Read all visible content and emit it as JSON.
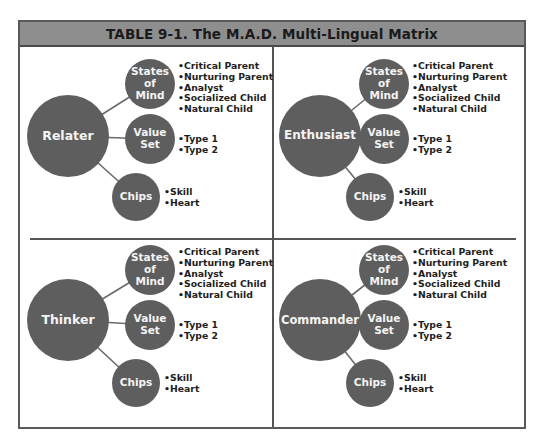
{
  "title": "TABLE 9-1.  The M.A.D. Multi-Lingual Matrix",
  "colors": {
    "header_bg": "#8e8e8e",
    "circle_fill": "#5e5e5e",
    "circle_text": "#f4f4f4",
    "border": "#555555",
    "list_text": "#1e1e1e"
  },
  "quadrants": [
    {
      "type": "Relater",
      "nodes": [
        {
          "label": "States of Mind",
          "lines": [
            "States",
            "of",
            "Mind"
          ],
          "items": [
            "Critical Parent",
            "Nurturing Parent",
            "Analyst",
            "Socialized Child",
            "Natural Child"
          ]
        },
        {
          "label": "Value Set",
          "lines": [
            "Value",
            "Set"
          ],
          "items": [
            "Type 1",
            "Type 2"
          ]
        },
        {
          "label": "Chips",
          "lines": [
            "Chips"
          ],
          "items": [
            "Skill",
            "Heart"
          ]
        }
      ]
    },
    {
      "type": "Enthusiast",
      "nodes": [
        {
          "label": "States of Mind",
          "lines": [
            "States",
            "of",
            "Mind"
          ],
          "items": [
            "Critical Parent",
            "Nurturing Parent",
            "Analyst",
            "Socialized Child",
            "Natural Child"
          ]
        },
        {
          "label": "Value Set",
          "lines": [
            "Value",
            "Set"
          ],
          "items": [
            "Type 1",
            "Type 2"
          ]
        },
        {
          "label": "Chips",
          "lines": [
            "Chips"
          ],
          "items": [
            "Skill",
            "Heart"
          ]
        }
      ]
    },
    {
      "type": "Thinker",
      "nodes": [
        {
          "label": "States of Mind",
          "lines": [
            "States",
            "of",
            "Mind"
          ],
          "items": [
            "Critical Parent",
            "Nurturing Parent",
            "Analyst",
            "Socialized Child",
            "Natural Child"
          ]
        },
        {
          "label": "Value Set",
          "lines": [
            "Value",
            "Set"
          ],
          "items": [
            "Type 1",
            "Type 2"
          ]
        },
        {
          "label": "Chips",
          "lines": [
            "Chips"
          ],
          "items": [
            "Skill",
            "Heart"
          ]
        }
      ]
    },
    {
      "type": "Commander",
      "nodes": [
        {
          "label": "States of Mind",
          "lines": [
            "States",
            "of",
            "Mind"
          ],
          "items": [
            "Critical Parent",
            "Nurturing Parent",
            "Analyst",
            "Socialized Child",
            "Natural Child"
          ]
        },
        {
          "label": "Value Set",
          "lines": [
            "Value",
            "Set"
          ],
          "items": [
            "Type 1",
            "Type 2"
          ]
        },
        {
          "label": "Chips",
          "lines": [
            "Chips"
          ],
          "items": [
            "Skill",
            "Heart"
          ]
        }
      ]
    }
  ]
}
